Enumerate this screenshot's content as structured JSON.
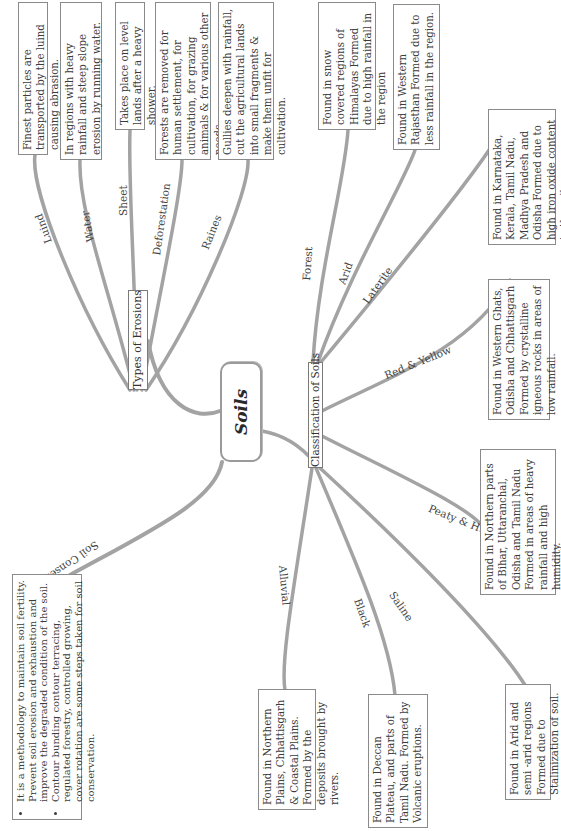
{
  "root": {
    "label": "Soils"
  },
  "erosions": {
    "hub_label": "Types of Erosions",
    "branches": [
      {
        "label": "Luind",
        "note": "Finest particles are transported by the luind causing abrasion."
      },
      {
        "label": "Water",
        "note": "In regions with heavy rainfall and steep slope erosion by running water."
      },
      {
        "label": "Sheet",
        "note": "Takes place on level lands after a heavy shower."
      },
      {
        "label": "Deforestation",
        "note": "Forests are removed for human settlement, for cultivation, for grazing animals & for various other needs."
      },
      {
        "label": "Raines",
        "note": "Gullies deepen with rainfall, cut the agricultural lands into small fragments & make them unfit for cultivation."
      }
    ]
  },
  "classification": {
    "hub_label": "Classification of Soils",
    "branches": [
      {
        "label": "Forest",
        "note": "Found in snow covered regions of Himalayas Formed due to high rainfall in the region"
      },
      {
        "label": "Arid",
        "note": "Found in Western Rajasthan Formed due to less rainfall in the region."
      },
      {
        "label": "Laterite",
        "note": "Found in Karnataka, Kerala, Tamil Nadu, Madhya Pradesh and Odisha Formed due to high iron oxide content in the soil."
      },
      {
        "label": "Red & Yellow",
        "note": "Found in Western Ghats, Odisha and Chhattisgarh Formed by crystalline igneous rocks in areas of low rainfall."
      },
      {
        "label": "Peaty & Humus",
        "note": "Found in Northern parts of Bihar, Uttaranchal, Odisha and Tamil Nadu Formed in areas of heavy rainfall and high humidity."
      },
      {
        "label": "Saline",
        "note": "Found in Arid and semi -arid regions Formed due to Stalinization of soil."
      },
      {
        "label": "Black",
        "note": "Found in Deccan Plateau, and parts of Tamil Nadu. Formed by Volcanic eruptions."
      },
      {
        "label": "Alluvial",
        "note": "Found in Northern Plains, Chhattisgarh & Coastal Plains. Formed by the deposits brought by rivers."
      }
    ]
  },
  "conservation": {
    "label": "Soil Conservation",
    "points": [
      "It is a methodology to maintain soil fertility. Prevent soil erosion and exhaustion and improve the degraded condition of the soil.",
      "Contour bunding contour terracing, regulated forestry, controlled growing, cover rotation are some steps taken for soil conservation."
    ]
  },
  "colors": {
    "branch": "#9b9b9b",
    "border": "#8a8a8a",
    "text": "#3c3c3c"
  }
}
